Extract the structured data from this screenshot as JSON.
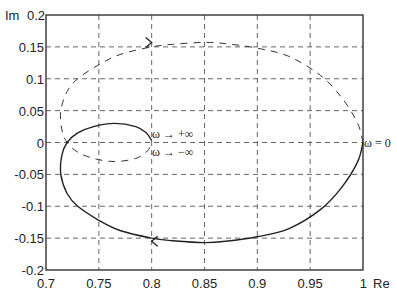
{
  "chart_data": {
    "type": "line",
    "title": "",
    "xlabel": "Re",
    "ylabel": "Im",
    "xlim": [
      0.7,
      1.0
    ],
    "ylim": [
      -0.2,
      0.2
    ],
    "grid": true,
    "x_ticks": [
      "0.7",
      "0.75",
      "0.8",
      "0.85",
      "0.9",
      "0.95",
      "1"
    ],
    "y_ticks": [
      "0.2",
      "0.15",
      "0.1",
      "0.05",
      "0",
      "-0.05",
      "-0.1",
      "-0.15",
      "-0.2"
    ],
    "series": [
      {
        "name": "ω from 0 to +∞",
        "style": "solid",
        "x": [
          1.0,
          0.995,
          0.98,
          0.96,
          0.93,
          0.9,
          0.87,
          0.85,
          0.82,
          0.8,
          0.77,
          0.75,
          0.73,
          0.72,
          0.714,
          0.715,
          0.72,
          0.73,
          0.745,
          0.765,
          0.785,
          0.795,
          0.8
        ],
        "y": [
          0.0,
          -0.03,
          -0.07,
          -0.105,
          -0.135,
          -0.148,
          -0.155,
          -0.157,
          -0.154,
          -0.15,
          -0.138,
          -0.122,
          -0.1,
          -0.08,
          -0.05,
          -0.02,
          0.0,
          0.015,
          0.025,
          0.03,
          0.025,
          0.015,
          0.003
        ]
      },
      {
        "name": "ω from 0 to -∞",
        "style": "dashed",
        "x": [
          1.0,
          0.995,
          0.98,
          0.96,
          0.93,
          0.9,
          0.87,
          0.85,
          0.82,
          0.8,
          0.77,
          0.75,
          0.73,
          0.72,
          0.714,
          0.715,
          0.72,
          0.73,
          0.745,
          0.765,
          0.785,
          0.795,
          0.8
        ],
        "y": [
          0.0,
          0.03,
          0.07,
          0.105,
          0.135,
          0.148,
          0.155,
          0.157,
          0.154,
          0.15,
          0.138,
          0.122,
          0.1,
          0.08,
          0.05,
          0.02,
          0.0,
          -0.015,
          -0.025,
          -0.03,
          -0.025,
          -0.015,
          -0.003
        ]
      }
    ],
    "annotations": [
      {
        "text": "ω → +∞",
        "x": 0.8,
        "y": 0.005
      },
      {
        "text": "ω → −∞",
        "x": 0.8,
        "y": -0.02
      },
      {
        "text": "ω = 0",
        "x": 1.0,
        "y": 0.0
      }
    ],
    "arrows": [
      {
        "series": "dashed",
        "x": 0.8,
        "y": 0.157,
        "direction": "right"
      },
      {
        "series": "solid",
        "x": 0.8,
        "y": -0.155,
        "direction": "left"
      }
    ]
  },
  "labels": {
    "y_axis_label": "Im",
    "x_axis_label": "Re",
    "ann_pos_inf": "ω → +∞",
    "ann_neg_inf": "ω → −∞",
    "ann_zero": "ω = 0"
  }
}
